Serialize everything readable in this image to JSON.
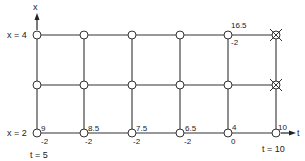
{
  "diagram": {
    "axes": {
      "x_axis_label": "x",
      "t_axis_label": "t"
    },
    "row_labels": {
      "top": "x = 4",
      "bottom": "x = 2"
    },
    "column_labels": {
      "left": "t = 5",
      "right": "t = 10"
    },
    "grid": {
      "columns": 6,
      "rows": 3,
      "line_color": "#333333",
      "node_fill": "#ffffff"
    },
    "bottom_row_values": [
      {
        "top": "9",
        "bottom": "-2"
      },
      {
        "top": "8.5",
        "bottom": "-2"
      },
      {
        "top": "7.5",
        "bottom": "-2"
      },
      {
        "top": "6.5",
        "bottom": "-2"
      },
      {
        "top": "4",
        "bottom": "0"
      },
      {
        "top": "10",
        "bottom": ""
      }
    ],
    "top_row_annotation": {
      "top": "16.5",
      "bottom": "-2"
    },
    "crossed_nodes": [
      "top-right",
      "middle-right"
    ]
  }
}
